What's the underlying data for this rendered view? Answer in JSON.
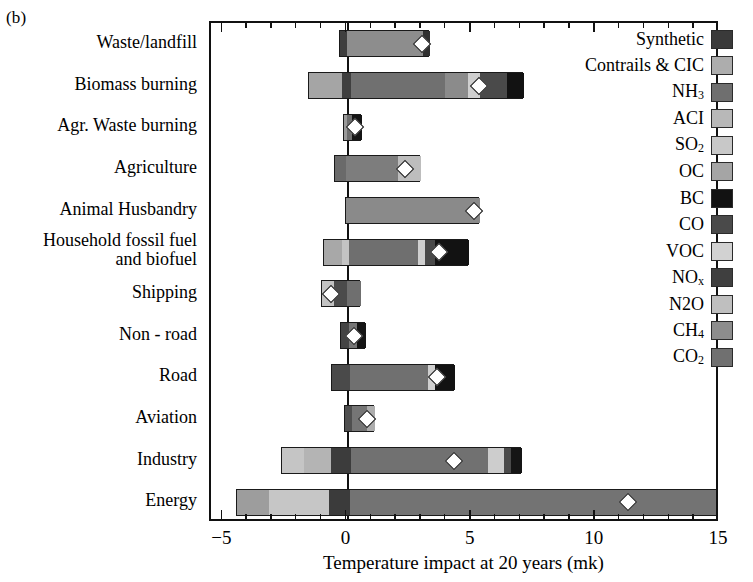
{
  "figure": {
    "panel_label": "(b)",
    "xaxis_title": "Temperature impact at 20 years (mk)"
  },
  "chart_data": {
    "type": "bar",
    "orientation": "horizontal",
    "title": "",
    "xlabel": "Temperature impact at 20 years (mk)",
    "ylabel": "",
    "xlim": [
      -5.5,
      15.0
    ],
    "xticks": [
      -5,
      0,
      5,
      10,
      15
    ],
    "xticklabels": [
      "−5",
      "0",
      "5",
      "10",
      "15"
    ],
    "grid": false,
    "zero_line": true,
    "units": "mk",
    "legend_position": "upper right (inside axes)",
    "legend_entries": [
      {
        "label": "Synthetic",
        "key": "Synthetic",
        "color": "#3a3a3a"
      },
      {
        "label": "Contrails & CIC",
        "key": "Contrails",
        "color": "#adadad"
      },
      {
        "label": "NH3",
        "key": "NH3",
        "color": "#6f6f6f"
      },
      {
        "label": "ACI",
        "key": "ACI",
        "color": "#b8b8b8"
      },
      {
        "label": "SO2",
        "key": "SO2",
        "color": "#c8c8c8"
      },
      {
        "label": "OC",
        "key": "OC",
        "color": "#a5a5a5"
      },
      {
        "label": "BC",
        "key": "BC",
        "color": "#121212"
      },
      {
        "label": "CO",
        "key": "CO",
        "color": "#4a4a4a"
      },
      {
        "label": "VOC",
        "key": "VOC",
        "color": "#d2d2d2"
      },
      {
        "label": "NOx",
        "key": "NOx",
        "color": "#3f3f3f"
      },
      {
        "label": "N2O",
        "key": "N2O",
        "color": "#bfbfbf"
      },
      {
        "label": "CH4",
        "key": "CH4",
        "color": "#8d8d8d"
      },
      {
        "label": "CO2",
        "key": "CO2",
        "color": "#707070"
      }
    ],
    "categories": [
      "Waste/landfill",
      "Biomass burning",
      "Agr. Waste burning",
      "Agriculture",
      "Animal Husbandry",
      "Household fossil fuel\nand biofuel",
      "Shipping",
      "Non - road",
      "Road",
      "Aviation",
      "Industry",
      "Energy"
    ],
    "net_values": [
      3.0,
      5.3,
      0.3,
      2.3,
      5.1,
      3.7,
      -0.65,
      0.25,
      3.6,
      0.8,
      4.3,
      11.3
    ],
    "bars": [
      {
        "category": "Waste/landfill",
        "net": 3.0,
        "start": -0.35,
        "end": 3.3,
        "segments": [
          {
            "key": "NOx",
            "color": "#3f3f3f",
            "from": -0.35,
            "to": -0.05
          },
          {
            "key": "CH4",
            "color": "#8d8d8d",
            "from": -0.05,
            "to": 3.0
          },
          {
            "key": "Synthetic",
            "color": "#303030",
            "from": 3.0,
            "to": 3.3
          }
        ]
      },
      {
        "category": "Biomass burning",
        "net": 5.3,
        "start": -1.6,
        "end": 7.05,
        "segments": [
          {
            "key": "OC",
            "color": "#a5a5a5",
            "from": -1.6,
            "to": -0.25
          },
          {
            "key": "NOx",
            "color": "#3f3f3f",
            "from": -0.25,
            "to": 0.1
          },
          {
            "key": "CO2",
            "color": "#707070",
            "from": 0.1,
            "to": 3.9
          },
          {
            "key": "CH4",
            "color": "#8b8b8b",
            "from": 3.9,
            "to": 4.8
          },
          {
            "key": "VOC",
            "color": "#cfcfcf",
            "from": 4.8,
            "to": 5.3
          },
          {
            "key": "CO",
            "color": "#4a4a4a",
            "from": 5.3,
            "to": 6.4
          },
          {
            "key": "BC",
            "color": "#121212",
            "from": 6.4,
            "to": 7.05
          }
        ]
      },
      {
        "category": "Agr. Waste burning",
        "net": 0.3,
        "start": -0.2,
        "end": 0.55,
        "segments": [
          {
            "key": "OC",
            "color": "#9a9a9a",
            "from": -0.2,
            "to": -0.05
          },
          {
            "key": "CO2",
            "color": "#6e6e6e",
            "from": -0.05,
            "to": 0.15
          },
          {
            "key": "BC",
            "color": "#141414",
            "from": 0.15,
            "to": 0.55
          }
        ]
      },
      {
        "category": "Agriculture",
        "net": 2.3,
        "start": -0.55,
        "end": 2.9,
        "segments": [
          {
            "key": "NOx",
            "color": "#6a6a6a",
            "from": -0.55,
            "to": -0.1
          },
          {
            "key": "CH4",
            "color": "#7d7d7d",
            "from": -0.1,
            "to": 2.0
          },
          {
            "key": "N2O",
            "color": "#bdbdbd",
            "from": 2.0,
            "to": 2.9
          }
        ]
      },
      {
        "category": "Animal Husbandry",
        "net": 5.1,
        "start": -0.1,
        "end": 5.3,
        "segments": [
          {
            "key": "CH4",
            "color": "#8a8a8a",
            "from": -0.1,
            "to": 5.3
          }
        ]
      },
      {
        "category": "Household fossil fuel and biofuel",
        "net": 3.7,
        "start": -1.0,
        "end": 4.85,
        "segments": [
          {
            "key": "OC",
            "color": "#a8a8a8",
            "from": -1.0,
            "to": -0.25
          },
          {
            "key": "SO2",
            "color": "#c4c4c4",
            "from": -0.25,
            "to": 0.0
          },
          {
            "key": "CO2",
            "color": "#6f6f6f",
            "from": 0.0,
            "to": 2.8
          },
          {
            "key": "VOC",
            "color": "#d0d0d0",
            "from": 2.8,
            "to": 3.1
          },
          {
            "key": "CO",
            "color": "#4a4a4a",
            "from": 3.1,
            "to": 3.5
          },
          {
            "key": "BC",
            "color": "#121212",
            "from": 3.5,
            "to": 4.85
          }
        ]
      },
      {
        "category": "Shipping",
        "net": -0.65,
        "start": -1.05,
        "end": 0.5,
        "segments": [
          {
            "key": "SO2",
            "color": "#c2c2c2",
            "from": -1.05,
            "to": -0.6
          },
          {
            "key": "NOx",
            "color": "#4b4b4b",
            "from": -0.6,
            "to": -0.05
          },
          {
            "key": "CO2",
            "color": "#6f6f6f",
            "from": -0.05,
            "to": 0.5
          }
        ]
      },
      {
        "category": "Non - road",
        "net": 0.25,
        "start": -0.3,
        "end": 0.7,
        "segments": [
          {
            "key": "NOx",
            "color": "#444444",
            "from": -0.3,
            "to": 0.0
          },
          {
            "key": "CO2",
            "color": "#767676",
            "from": 0.0,
            "to": 0.35
          },
          {
            "key": "BC",
            "color": "#151515",
            "from": 0.35,
            "to": 0.7
          }
        ]
      },
      {
        "category": "Road",
        "net": 3.6,
        "start": -0.65,
        "end": 4.3,
        "segments": [
          {
            "key": "NOx",
            "color": "#4a4a4a",
            "from": -0.65,
            "to": 0.05
          },
          {
            "key": "CO2",
            "color": "#707070",
            "from": 0.05,
            "to": 3.2
          },
          {
            "key": "VOC",
            "color": "#cfcfcf",
            "from": 3.2,
            "to": 3.5
          },
          {
            "key": "BC",
            "color": "#121212",
            "from": 3.5,
            "to": 4.3
          }
        ]
      },
      {
        "category": "Aviation",
        "net": 0.8,
        "start": -0.15,
        "end": 1.05,
        "segments": [
          {
            "key": "NOx",
            "color": "#4f4f4f",
            "from": -0.15,
            "to": 0.15
          },
          {
            "key": "CO2",
            "color": "#757575",
            "from": 0.15,
            "to": 0.75
          },
          {
            "key": "Contrails",
            "color": "#adadad",
            "from": 0.75,
            "to": 1.05
          }
        ]
      },
      {
        "category": "Industry",
        "net": 4.3,
        "start": -2.7,
        "end": 7.0,
        "segments": [
          {
            "key": "SO2",
            "color": "#c5c5c5",
            "from": -2.7,
            "to": -1.8
          },
          {
            "key": "ACI",
            "color": "#b4b4b4",
            "from": -1.8,
            "to": -0.7
          },
          {
            "key": "NOx",
            "color": "#3c3c3c",
            "from": -0.7,
            "to": 0.1
          },
          {
            "key": "CO2",
            "color": "#717171",
            "from": 0.1,
            "to": 5.6
          },
          {
            "key": "VOC",
            "color": "#cdcdcd",
            "from": 5.6,
            "to": 6.25
          },
          {
            "key": "CO",
            "color": "#4a4a4a",
            "from": 6.25,
            "to": 6.55
          },
          {
            "key": "BC",
            "color": "#151515",
            "from": 6.55,
            "to": 7.0
          }
        ]
      },
      {
        "category": "Energy",
        "net": 11.3,
        "start": -4.5,
        "end": 15.0,
        "segments": [
          {
            "key": "SO2",
            "color": "#9d9d9d",
            "from": -4.5,
            "to": -3.2
          },
          {
            "key": "ACI",
            "color": "#c6c6c6",
            "from": -3.2,
            "to": -0.8
          },
          {
            "key": "NOx",
            "color": "#3b3b3b",
            "from": -0.8,
            "to": 0.05
          },
          {
            "key": "CO2",
            "color": "#737373",
            "from": 0.05,
            "to": 14.8
          },
          {
            "key": "BC",
            "color": "#141414",
            "from": 14.8,
            "to": 15.0
          }
        ]
      }
    ]
  }
}
